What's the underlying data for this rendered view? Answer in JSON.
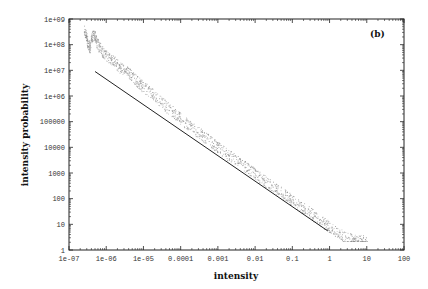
{
  "chart_data": {
    "type": "scatter",
    "title": "",
    "panel_label": "(b)",
    "xlabel": "intensity",
    "ylabel": "intensity probability",
    "xscale": "log",
    "yscale": "log",
    "xlim": [
      1e-07,
      100
    ],
    "ylim": [
      1,
      1000000000.0
    ],
    "x_ticks": [
      "1e-07",
      "1e-06",
      "1e-05",
      "0.0001",
      "0.001",
      "0.01",
      "0.1",
      "1",
      "10",
      "100"
    ],
    "y_ticks": [
      "1",
      "10",
      "100",
      "1000",
      "10000",
      "100000",
      "1e+06",
      "1e+07",
      "1e+08",
      "1e+09"
    ],
    "grid": false,
    "legend": null,
    "series": [
      {
        "name": "measured distribution",
        "style": "dots",
        "color": "#8a8a8a",
        "points": [
          [
            2.5e-07,
            400000000.0
          ],
          [
            2.8e-07,
            250000000.0
          ],
          [
            3e-07,
            150000000.0
          ],
          [
            3.3e-07,
            100000000.0
          ],
          [
            3.6e-07,
            80000000.0
          ],
          [
            4e-07,
            200000000.0
          ],
          [
            4.5e-07,
            260000000.0
          ],
          [
            5e-07,
            200000000.0
          ],
          [
            5.5e-07,
            120000000.0
          ],
          [
            6.5e-07,
            80000000.0
          ],
          [
            8e-07,
            55000000.0
          ],
          [
            1e-06,
            40000000.0
          ],
          [
            1.3e-06,
            28000000.0
          ],
          [
            1.6e-06,
            22000000.0
          ],
          [
            2e-06,
            16000000.0
          ],
          [
            2.5e-06,
            12000000.0
          ],
          [
            3.2e-06,
            10000000.0
          ],
          [
            4e-06,
            8000000.0
          ],
          [
            5e-06,
            6000000.0
          ],
          [
            6.5e-06,
            4000000.0
          ],
          [
            8e-06,
            3000000.0
          ],
          [
            1e-05,
            2200000.0
          ],
          [
            1.5e-05,
            1500000.0
          ],
          [
            2e-05,
            1000000.0
          ],
          [
            3e-05,
            600000.0
          ],
          [
            4e-05,
            400000.0
          ],
          [
            6e-05,
            250000.0
          ],
          [
            8e-05,
            180000.0
          ],
          [
            0.0001,
            130000.0
          ],
          [
            0.00015,
            80000.0
          ],
          [
            0.0002,
            60000.0
          ],
          [
            0.0003,
            38000.0
          ],
          [
            0.0004,
            28000.0
          ],
          [
            0.0006,
            18000.0
          ],
          [
            0.0008,
            13000.0
          ],
          [
            0.001,
            10000.0
          ],
          [
            0.0015,
            6500.0
          ],
          [
            0.002,
            4800.0
          ],
          [
            0.003,
            3200.0
          ],
          [
            0.004,
            2400.0
          ],
          [
            0.006,
            1600.0
          ],
          [
            0.008,
            1200.0
          ],
          [
            0.01,
            900.0
          ],
          [
            0.015,
            600.0
          ],
          [
            0.02,
            450.0
          ],
          [
            0.03,
            300.0
          ],
          [
            0.04,
            220.0
          ],
          [
            0.06,
            150.0
          ],
          [
            0.08,
            110.0
          ],
          [
            0.1,
            85
          ],
          [
            0.15,
            55
          ],
          [
            0.2,
            42
          ],
          [
            0.3,
            28
          ],
          [
            0.4,
            20
          ],
          [
            0.6,
            13
          ],
          [
            0.8,
            10
          ],
          [
            1.0,
            8
          ],
          [
            1.5,
            5
          ],
          [
            2.0,
            4
          ],
          [
            3.0,
            3
          ],
          [
            4.0,
            2.5
          ],
          [
            5.0,
            2.5
          ],
          [
            7.0,
            2.5
          ],
          [
            10.0,
            2.5
          ]
        ],
        "band_width_decades": 0.45
      },
      {
        "name": "power-law fit",
        "style": "line",
        "color": "#222222",
        "points": [
          [
            5e-07,
            9000000.0
          ],
          [
            0.9,
            5.5
          ]
        ]
      }
    ]
  }
}
